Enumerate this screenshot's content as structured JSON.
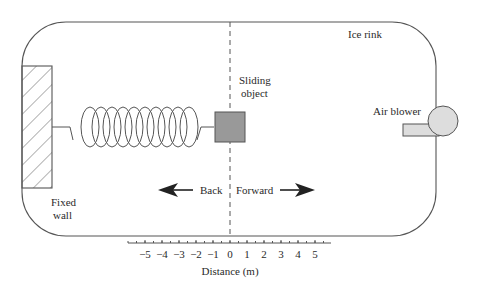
{
  "labels": {
    "rink": "Ice rink",
    "object_line1": "Sliding",
    "object_line2": "object",
    "blower": "Air blower",
    "wall_line1": "Fixed",
    "wall_line2": "wall",
    "back": "Back",
    "forward": "Forward"
  },
  "axis": {
    "label": "Distance (m)",
    "ticks": [
      "−5",
      "−4",
      "−3",
      "−2",
      "−1",
      "0",
      "1",
      "2",
      "3",
      "4",
      "5"
    ]
  },
  "colors": {
    "stroke": "#555555",
    "object_fill": "#999999",
    "blower_fill": "#dddddd"
  }
}
